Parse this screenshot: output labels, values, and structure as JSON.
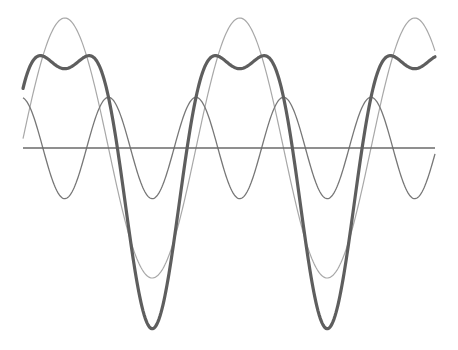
{
  "chart_data": {
    "type": "line",
    "title": "",
    "xlabel": "",
    "ylabel": "",
    "grid": false,
    "legend": null,
    "x_range": [
      0,
      4.7
    ],
    "x_units": "cycles of fundamental (period ≈ 175 px)",
    "ylim": [
      -1.45,
      1.3
    ],
    "series": [
      {
        "name": "fundamental",
        "expression": "1.0 * sin(t)",
        "amplitude": 1.0,
        "harmonic": 1,
        "color": "#a8a8a8",
        "stroke_width": 1.2
      },
      {
        "name": "second harmonic",
        "expression": "0.39 * cos(2t)",
        "amplitude": 0.39,
        "harmonic": 2,
        "color": "#777777",
        "stroke_width": 1.3
      },
      {
        "name": "sum",
        "expression": "sin(t) + 0.39 * cos(2t)",
        "color": "#5e5e5e",
        "stroke_width": 3.2
      }
    ],
    "baseline": {
      "y": 0,
      "color": "#6a6a6a"
    }
  },
  "layout": {
    "width": 458,
    "height": 350,
    "x_start": 23,
    "x_end": 435,
    "phase_origin_px": 21,
    "period_px": 175,
    "center_y": 148,
    "unit_px": 130
  }
}
